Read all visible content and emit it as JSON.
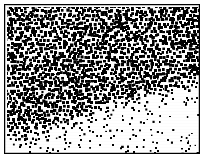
{
  "figure": {
    "kind": "dithered-dot-density-texture",
    "width": 207,
    "height": 160,
    "background_color": "#ffffff",
    "ink_color": "#000000"
  },
  "frame": {
    "name": "plate-border",
    "x": 4,
    "y": 4,
    "width": 196,
    "height": 150,
    "stroke_color": "#000000",
    "stroke_width": 1.5
  },
  "plate": {
    "inner_x": 6,
    "inner_y": 6,
    "inner_width": 192,
    "inner_height": 146
  },
  "chart_data": {
    "type": "heatmap",
    "subtitle": "",
    "xlabel": "",
    "ylabel": "",
    "grid": false,
    "legend": "none",
    "colormap": [
      "#ffffff",
      "#000000"
    ],
    "render": "stochastic-square-dots",
    "dot_shape": "square",
    "dot_min_size": 1.2,
    "dot_max_size": 2.9,
    "cell_pitch_x": 4.15,
    "cell_pitch_y": 4.15,
    "jitter": 0.42,
    "xlim": [
      0,
      192
    ],
    "ylim": [
      0,
      146
    ],
    "density_range": [
      0.06,
      1.0
    ],
    "field_nodes": [
      {
        "label": "top-left-dense-corner",
        "x": 0.04,
        "y": 0.04,
        "sigma_x": 0.3,
        "sigma_y": 0.26,
        "amplitude": 1.0
      },
      {
        "label": "top-left-upper-band",
        "x": 0.17,
        "y": 0.0,
        "sigma_x": 0.24,
        "sigma_y": 0.16,
        "amplitude": 0.82
      },
      {
        "label": "left-upper-mid-lobe",
        "x": 0.02,
        "y": 0.22,
        "sigma_x": 0.2,
        "sigma_y": 0.18,
        "amplitude": 0.74
      },
      {
        "label": "central-wave-crest-a",
        "x": 0.3,
        "y": 0.37,
        "sigma_x": 0.15,
        "sigma_y": 0.13,
        "amplitude": 0.92
      },
      {
        "label": "central-wave-crest-b",
        "x": 0.42,
        "y": 0.43,
        "sigma_x": 0.16,
        "sigma_y": 0.12,
        "amplitude": 0.88
      },
      {
        "label": "central-wave-crest-c",
        "x": 0.55,
        "y": 0.44,
        "sigma_x": 0.15,
        "sigma_y": 0.11,
        "amplitude": 0.8
      },
      {
        "label": "right-flank-lobe",
        "x": 0.74,
        "y": 0.4,
        "sigma_x": 0.16,
        "sigma_y": 0.13,
        "amplitude": 0.86
      },
      {
        "label": "right-edge-upper-lobe",
        "x": 0.93,
        "y": 0.34,
        "sigma_x": 0.14,
        "sigma_y": 0.14,
        "amplitude": 0.88
      },
      {
        "label": "right-edge-top-band",
        "x": 0.95,
        "y": 0.08,
        "sigma_x": 0.12,
        "sigma_y": 0.14,
        "amplitude": 0.6
      },
      {
        "label": "left-lower-dense-lobe",
        "x": 0.04,
        "y": 0.68,
        "sigma_x": 0.19,
        "sigma_y": 0.16,
        "amplitude": 0.95
      },
      {
        "label": "left-lower-tail",
        "x": 0.18,
        "y": 0.61,
        "sigma_x": 0.16,
        "sigma_y": 0.13,
        "amplitude": 0.7
      },
      {
        "label": "mid-lower-fade",
        "x": 0.33,
        "y": 0.6,
        "sigma_x": 0.15,
        "sigma_y": 0.12,
        "amplitude": 0.5
      },
      {
        "label": "top-centre-medium",
        "x": 0.55,
        "y": 0.1,
        "sigma_x": 0.3,
        "sigma_y": 0.16,
        "amplitude": 0.42
      },
      {
        "label": "upper-right-medium",
        "x": 0.82,
        "y": 0.12,
        "sigma_x": 0.22,
        "sigma_y": 0.16,
        "amplitude": 0.46
      },
      {
        "label": "bottom-edge-trace",
        "x": 0.45,
        "y": 1.0,
        "sigma_x": 0.45,
        "sigma_y": 0.1,
        "amplitude": 0.22
      }
    ],
    "baseline_density": 0.155,
    "regions": [
      {
        "name": "top-left",
        "x_frac": 0.08,
        "y_frac": 0.1,
        "density": 0.96,
        "note": "near-solid, dots merging"
      },
      {
        "name": "top-centre",
        "x_frac": 0.45,
        "y_frac": 0.12,
        "density": 0.33,
        "note": "regular medium-sparse grid"
      },
      {
        "name": "top-right",
        "x_frac": 0.85,
        "y_frac": 0.12,
        "density": 0.4,
        "note": "uniform medium"
      },
      {
        "name": "left-middle",
        "x_frac": 0.08,
        "y_frac": 0.42,
        "density": 0.46,
        "note": "medium"
      },
      {
        "name": "centre",
        "x_frac": 0.45,
        "y_frac": 0.45,
        "density": 0.85,
        "note": "dense diagonal band"
      },
      {
        "name": "right-middle",
        "x_frac": 0.85,
        "y_frac": 0.42,
        "density": 0.8,
        "note": "dense band fading downward"
      },
      {
        "name": "left-lower",
        "x_frac": 0.08,
        "y_frac": 0.7,
        "density": 0.9,
        "note": "dense lobe"
      },
      {
        "name": "bottom-centre",
        "x_frac": 0.45,
        "y_frac": 0.85,
        "density": 0.14,
        "note": "sparse regular dots"
      },
      {
        "name": "bottom-right",
        "x_frac": 0.85,
        "y_frac": 0.85,
        "density": 0.17,
        "note": "sparse regular dots"
      }
    ]
  }
}
